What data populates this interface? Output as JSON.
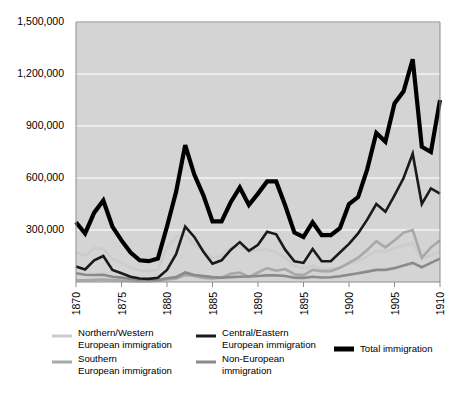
{
  "chart_data": {
    "type": "line",
    "title": "",
    "subtitle": "",
    "xlabel": "",
    "ylabel": "",
    "xlim": [
      1870,
      1910
    ],
    "ylim": [
      0,
      1500000
    ],
    "grid": true,
    "grid_axis": "y",
    "legend_position": "bottom",
    "y_ticks": [
      0,
      300000,
      600000,
      900000,
      1200000,
      1500000
    ],
    "y_tick_labels": [
      "",
      "300,000",
      "600,000",
      "900,000",
      "1,200,000",
      "1,500,000"
    ],
    "x_ticks": [
      1870,
      1875,
      1880,
      1885,
      1890,
      1895,
      1900,
      1905,
      1910
    ],
    "x_tick_labels": [
      "1870",
      "1875",
      "1880",
      "1885",
      "1890",
      "1895",
      "1900",
      "1905",
      "1910"
    ],
    "x": [
      1870,
      1871,
      1872,
      1873,
      1874,
      1875,
      1876,
      1877,
      1878,
      1879,
      1880,
      1881,
      1882,
      1883,
      1884,
      1885,
      1886,
      1887,
      1888,
      1889,
      1890,
      1891,
      1892,
      1893,
      1894,
      1895,
      1896,
      1897,
      1898,
      1899,
      1900,
      1901,
      1902,
      1903,
      1904,
      1905,
      1906,
      1907,
      1908,
      1909,
      1910
    ],
    "series": [
      {
        "name": "Northern/Western European immigration",
        "color": "#cccccc",
        "width": 2.6,
        "values": [
          172000,
          150000,
          195000,
          190000,
          133000,
          110000,
          83000,
          66000,
          62000,
          72000,
          197000,
          260000,
          270000,
          215000,
          185000,
          140000,
          150000,
          200000,
          205000,
          175000,
          185000,
          190000,
          170000,
          140000,
          90000,
          80000,
          95000,
          72000,
          78000,
          84000,
          105000,
          120000,
          148000,
          180000,
          175000,
          195000,
          210000,
          225000,
          135000,
          155000,
          175000
        ]
      },
      {
        "name": "Southern European immigration",
        "color": "#a8a8a8",
        "width": 2.6,
        "values": [
          10000,
          10000,
          12000,
          14000,
          11000,
          9000,
          6000,
          5000,
          5000,
          7000,
          15000,
          20000,
          40000,
          35000,
          23000,
          20000,
          25000,
          48000,
          55000,
          30000,
          55000,
          80000,
          65000,
          75000,
          45000,
          40000,
          70000,
          63000,
          63000,
          82000,
          110000,
          140000,
          185000,
          235000,
          200000,
          240000,
          285000,
          300000,
          140000,
          200000,
          240000
        ]
      },
      {
        "name": "Non-European immigration",
        "color": "#8a8a8a",
        "width": 2.6,
        "values": [
          50000,
          42000,
          40000,
          42000,
          30000,
          25000,
          18000,
          13000,
          13000,
          12000,
          22000,
          28000,
          55000,
          40000,
          35000,
          28000,
          25000,
          28000,
          30000,
          32000,
          35000,
          38000,
          38000,
          35000,
          25000,
          24000,
          30000,
          26000,
          27000,
          33000,
          42000,
          50000,
          60000,
          70000,
          70000,
          80000,
          95000,
          110000,
          85000,
          110000,
          135000
        ]
      },
      {
        "name": "Central/Eastern European immigration",
        "color": "#1a1a1a",
        "width": 2.6,
        "values": [
          90000,
          72000,
          125000,
          150000,
          70000,
          50000,
          30000,
          20000,
          18000,
          25000,
          70000,
          160000,
          320000,
          260000,
          175000,
          105000,
          125000,
          185000,
          230000,
          180000,
          215000,
          290000,
          275000,
          185000,
          120000,
          110000,
          190000,
          120000,
          120000,
          170000,
          220000,
          280000,
          360000,
          450000,
          405000,
          500000,
          600000,
          740000,
          450000,
          540000,
          510000
        ]
      },
      {
        "name": "Total immigration",
        "color": "#000000",
        "width": 4.2,
        "values": [
          345000,
          280000,
          400000,
          470000,
          320000,
          240000,
          170000,
          125000,
          120000,
          135000,
          320000,
          520000,
          790000,
          620000,
          500000,
          350000,
          350000,
          460000,
          545000,
          445000,
          510000,
          580000,
          580000,
          440000,
          285000,
          260000,
          345000,
          270000,
          270000,
          310000,
          450000,
          490000,
          650000,
          860000,
          810000,
          1030000,
          1100000,
          1285000,
          780000,
          750000,
          1050000
        ]
      }
    ],
    "legend": [
      {
        "label": "Northern/Western European immigration",
        "color": "#cccccc",
        "width": 3
      },
      {
        "label": "Southern European immigration",
        "color": "#a8a8a8",
        "width": 3
      },
      {
        "label": "Central/Eastern European immigration",
        "color": "#1a1a1a",
        "width": 3
      },
      {
        "label": "Non-European immigration",
        "color": "#8a8a8a",
        "width": 3
      },
      {
        "label": "Total immigration",
        "color": "#000000",
        "width": 5
      }
    ],
    "colors": {
      "plot_background": "#d4d4d4",
      "gridline": "#f4f4f4",
      "axis": "#8d8d8d",
      "page_background": "#ffffff",
      "text": "#000000"
    }
  }
}
